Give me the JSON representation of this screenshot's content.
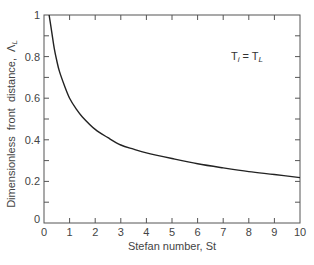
{
  "chart_data": {
    "type": "line",
    "title": "",
    "xlabel": "Stefan number, St",
    "ylabel": "Dimensionless front distance, Λ",
    "ylabel_subscript": "L",
    "xlim": [
      0,
      10
    ],
    "ylim": [
      0,
      1
    ],
    "xticks": [
      "0",
      "1",
      "2",
      "3",
      "4",
      "5",
      "6",
      "7",
      "8",
      "9",
      "10"
    ],
    "yticks": [
      "0",
      "0.2",
      "0.4",
      "0.6",
      "0.8",
      "1"
    ],
    "grid": false,
    "legend": null,
    "annotations": [
      {
        "text": "T",
        "sub1": "i",
        "eq": " = T",
        "sub2": "L",
        "x": 8.3,
        "y": 0.8
      }
    ],
    "series": [
      {
        "name": "T_i = T_L",
        "x": [
          0.2,
          0.3,
          0.4,
          0.5,
          0.6,
          0.8,
          1.0,
          1.25,
          1.5,
          2.0,
          2.5,
          3.0,
          3.5,
          4.0,
          5.0,
          6.0,
          7.0,
          8.0,
          9.0,
          10.0
        ],
        "y": [
          1.0,
          0.92,
          0.84,
          0.78,
          0.73,
          0.66,
          0.6,
          0.55,
          0.51,
          0.45,
          0.41,
          0.375,
          0.355,
          0.337,
          0.31,
          0.285,
          0.265,
          0.247,
          0.233,
          0.218
        ]
      }
    ]
  },
  "ui": {
    "xlabel": "Stefan number, St",
    "ylabel_main": "Dimensionless  front  distance,  Λ",
    "ylabel_sub": "L",
    "annotation_T": "T",
    "annotation_sub_i": "i",
    "annotation_eq": " = T",
    "annotation_sub_L": "L"
  }
}
